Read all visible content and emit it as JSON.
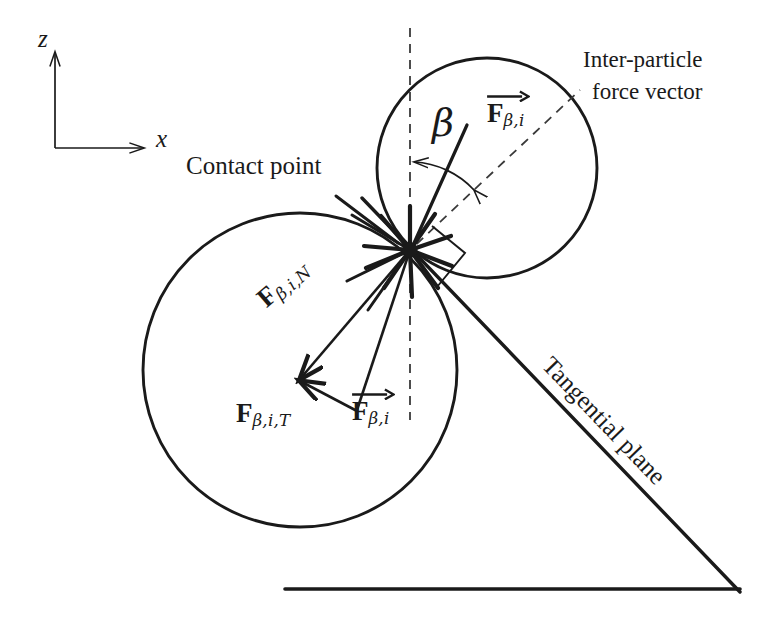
{
  "figure": {
    "kind": "two-particle contact force diagram",
    "background": "#ffffff",
    "ink": "#1a1a1a"
  },
  "axes": {
    "z_label": "z",
    "x_label": "x",
    "origin": [
      55,
      148
    ],
    "z_tip": [
      55,
      48
    ],
    "x_tip": [
      148,
      148
    ]
  },
  "labels": {
    "contact_point": "Contact point",
    "inter_particle_line1": "Inter-particle",
    "inter_particle_line2": "force vector",
    "tangential_plane": "Tangential plane",
    "beta": "β"
  },
  "force_labels": {
    "resultant": {
      "symbol": "F",
      "sub": "β,i",
      "has_vector_arrow": true
    },
    "normal": {
      "symbol": "F",
      "sub": "β,i,N",
      "has_vector_arrow": false
    },
    "tangential": {
      "symbol": "F",
      "sub": "β,i,T",
      "has_vector_arrow": false
    },
    "resultant_top": {
      "symbol": "F",
      "sub": "β,i",
      "has_vector_arrow": true
    }
  },
  "geometry": {
    "upper_circle": {
      "cx": 487,
      "cy": 168,
      "r": 110
    },
    "lower_circle": {
      "cx": 300,
      "cy": 370,
      "r": 157
    },
    "contact_point": {
      "x": 410,
      "y": 250
    },
    "dashed_vertical": {
      "x": 410,
      "y_top": 28,
      "y_bottom": 420
    },
    "dashed_force_line": {
      "x1": 410,
      "y1": 250,
      "x2": 578,
      "y2": 92
    },
    "tangential_plane_line": {
      "x1": 362,
      "y1": 198,
      "x2": 738,
      "y2": 590
    },
    "baseline": {
      "x1": 285,
      "y1": 589,
      "x2": 738,
      "y2": 589
    },
    "right_angle_marker": true,
    "beta_arc_radius": 88,
    "normal_force_arrow": {
      "x1": 410,
      "y1": 250,
      "x2": 297,
      "y2": 382
    },
    "tangential_force_arrow": {
      "x1": 356,
      "y1": 411,
      "x2": 297,
      "y2": 382
    },
    "resultant_force_arrow": {
      "x1": 410,
      "y1": 250,
      "x2": 356,
      "y2": 411
    }
  },
  "label_positions": {
    "z": [
      38,
      35
    ],
    "x": [
      155,
      131
    ],
    "contact_point": [
      186,
      158
    ],
    "inter_particle": [
      583,
      52
    ],
    "beta": [
      436,
      111
    ],
    "force_top": [
      487,
      104
    ],
    "force_normal": [
      252,
      297
    ],
    "force_tangential": [
      238,
      405
    ],
    "force_resultant": [
      352,
      400
    ],
    "tangential_plane": [
      600,
      350
    ]
  }
}
